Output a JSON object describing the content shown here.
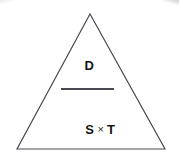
{
  "diagram": {
    "shape": "triangle",
    "background_color": "#ffffff",
    "outline_color": "#4a4a52",
    "text_color": "#141414",
    "formula": {
      "numerator": "D",
      "operator": "×",
      "denominator_left": "S",
      "denominator_right": "T",
      "bar_color": "#4a4a52"
    },
    "apex": {
      "x": 90,
      "y": 14
    },
    "base_left": {
      "x": 17,
      "y": 149
    },
    "base_right": {
      "x": 165,
      "y": 149
    }
  }
}
